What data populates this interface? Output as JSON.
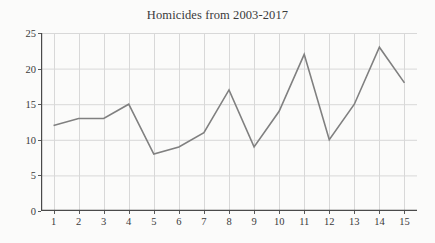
{
  "chart_data": {
    "type": "line",
    "title": "Homicides from 2003-2017",
    "xlabel": "",
    "ylabel": "",
    "categories": [
      "1",
      "2",
      "3",
      "4",
      "5",
      "6",
      "7",
      "8",
      "9",
      "10",
      "11",
      "12",
      "13",
      "14",
      "15"
    ],
    "values": [
      12,
      13,
      13,
      15,
      8,
      9,
      11,
      17,
      9,
      14,
      22,
      10,
      15,
      23,
      18
    ],
    "series": [
      {
        "name": "Homicides",
        "values": [
          12,
          13,
          13,
          15,
          8,
          9,
          11,
          17,
          9,
          14,
          22,
          10,
          15,
          23,
          18
        ]
      }
    ],
    "ylim": [
      0,
      25
    ],
    "yticks": [
      0,
      5,
      10,
      15,
      20,
      25
    ],
    "xticks": [
      "1",
      "2",
      "3",
      "4",
      "5",
      "6",
      "7",
      "8",
      "9",
      "10",
      "11",
      "12",
      "13",
      "14",
      "15"
    ],
    "grid": true,
    "legend": "none",
    "line_color": "#808080",
    "grid_color": "#d8d8d8",
    "axis_color": "#4a4a4a",
    "background_color": "#fbfbfa",
    "text_color": "#3a3a3a"
  }
}
